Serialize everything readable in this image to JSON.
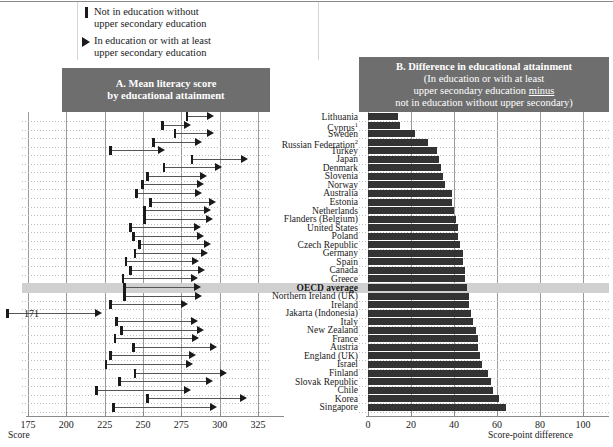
{
  "legend": {
    "items": [
      {
        "glyph": "bar",
        "line1": "Not in education without",
        "line2": "upper secondary education"
      },
      {
        "glyph": "triangle",
        "line1": "In education or with at least",
        "line2": "upper secondary education"
      }
    ]
  },
  "panel_a": {
    "title_line1": "A. Mean literacy score",
    "title_line2": "by educational attainment",
    "axis_label": "Score",
    "ticks": [
      175,
      200,
      225,
      250,
      275,
      300,
      325
    ],
    "annotation": "171"
  },
  "panel_b": {
    "title_line1": "B. Difference in educational attainment",
    "title_line2": "(In education or with at least",
    "title_line3a": "upper secondary education ",
    "title_line3b": "minus",
    "title_line4": "not in education without upper secondary)",
    "axis_label": "Score-point difference",
    "ticks": [
      0,
      20,
      40,
      60,
      80,
      100
    ]
  },
  "footnotes": {
    "cyprus": "1",
    "russia": "2"
  },
  "chart_data": {
    "type": "bar",
    "xlabel_a": "Score",
    "xlabel_b": "Score-point difference",
    "ylabel": "",
    "xlim_a": [
      175,
      325
    ],
    "xlim_b": [
      0,
      100
    ],
    "grid": true,
    "legend_position": "top",
    "categories": [
      "Lithuania",
      "Cyprus",
      "Sweden",
      "Russian Federation",
      "Turkey",
      "Japan",
      "Denmark",
      "Slovenia",
      "Norway",
      "Australia",
      "Estonia",
      "Netherlands",
      "Flanders (Belgium)",
      "United States",
      "Poland",
      "Czech Republic",
      "Germany",
      "Spain",
      "Canada",
      "Greece",
      "OECD average",
      "Northern Ireland (UK)",
      "Ireland",
      "Jakarta (Indonesia)",
      "Italy",
      "New Zealand",
      "France",
      "Austria",
      "England (UK)",
      "Israel",
      "Finland",
      "Slovak Republic",
      "Chile",
      "Korea",
      "Singapore"
    ],
    "series": [
      {
        "name": "Not in education without upper secondary education",
        "values": [
          278,
          262,
          270,
          256,
          228,
          281,
          263,
          252,
          249,
          245,
          254,
          250,
          250,
          241,
          243,
          247,
          244,
          238,
          241,
          236,
          237,
          237,
          228,
          171,
          232,
          235,
          231,
          243,
          228,
          225,
          244,
          234,
          219,
          252,
          230
        ]
      },
      {
        "name": "In education or with at least upper secondary education",
        "values": [
          292,
          277,
          292,
          284,
          260,
          314,
          297,
          287,
          285,
          284,
          293,
          290,
          291,
          283,
          285,
          290,
          288,
          282,
          286,
          281,
          283,
          284,
          275,
          219,
          281,
          285,
          282,
          294,
          280,
          278,
          300,
          291,
          277,
          313,
          294
        ]
      }
    ],
    "difference_values": [
      14,
      15,
      22,
      28,
      32,
      33,
      34,
      35,
      36,
      39,
      39,
      40,
      41,
      42,
      42,
      43,
      44,
      44,
      45,
      45,
      46,
      47,
      47,
      48,
      49,
      50,
      51,
      51,
      52,
      53,
      56,
      57,
      58,
      61,
      64
    ]
  }
}
